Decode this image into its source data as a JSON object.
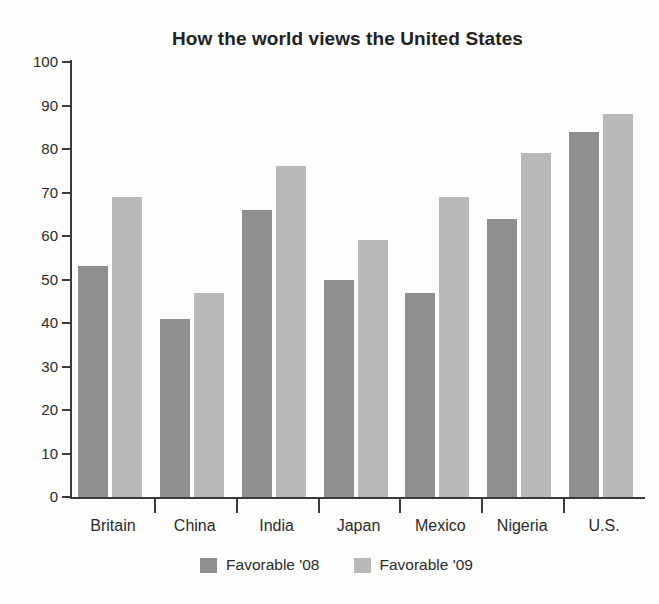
{
  "chart_data": {
    "type": "bar",
    "title": "How the world views the United States",
    "xlabel": "",
    "ylabel": "",
    "categories": [
      "Britain",
      "China",
      "India",
      "Japan",
      "Mexico",
      "Nigeria",
      "U.S."
    ],
    "series": [
      {
        "name": "Favorable '08",
        "color": "#8f8f8f",
        "values": [
          53,
          41,
          66,
          50,
          47,
          64,
          84
        ]
      },
      {
        "name": "Favorable '09",
        "color": "#b9b9b9",
        "values": [
          69,
          47,
          76,
          59,
          69,
          79,
          88
        ]
      }
    ],
    "ylim": [
      0,
      100
    ],
    "yticks": [
      0,
      10,
      20,
      30,
      40,
      50,
      60,
      70,
      80,
      90,
      100
    ],
    "ytick_labels": [
      "0",
      "10",
      "20",
      "30",
      "40",
      "50",
      "60",
      "70",
      "80",
      "90",
      "100"
    ],
    "grid": false,
    "legend_position": "bottom",
    "axis_color": "#3a3a3a",
    "background": "#fdfdfb"
  }
}
